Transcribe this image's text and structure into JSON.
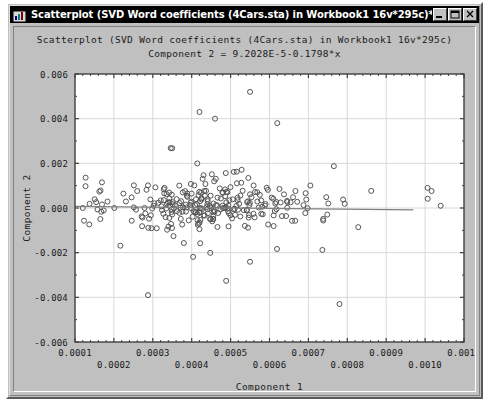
{
  "window": {
    "title": "Scatterplot (SVD Word coefficients (4Cars.sta) in Workbook1 16v*295c)*",
    "icon": "statistica-graph-icon",
    "controls": {
      "minimize": "Minimize",
      "maximize": "Maximize",
      "close": "Close"
    }
  },
  "chart_data": {
    "type": "scatter",
    "title": "Scatterplot (SVD Word coefficients (4Cars.sta) in Workbook1 16v*295c)",
    "subtitle": "Component 2 = 9.2028E-5-0.1798*x",
    "xlabel": "Component 1",
    "ylabel": "Component 2",
    "xlim": [
      0.0001,
      0.0011
    ],
    "ylim": [
      -0.006,
      0.006
    ],
    "xticks": [
      0.0001,
      0.0002,
      0.0003,
      0.0004,
      0.0005,
      0.0006,
      0.0007,
      0.0008,
      0.0009,
      0.001,
      0.0011
    ],
    "xtick_labels": [
      "0.0001",
      "0.0002",
      "0.0003",
      "0.0004",
      "0.0005",
      "0.0006",
      "0.0007",
      "0.0008",
      "0.0009",
      "0.0010",
      "0.0011"
    ],
    "xtick_stagger": true,
    "yticks": [
      0.006,
      0.004,
      0.002,
      0.0,
      -0.002,
      -0.004,
      -0.006
    ],
    "ytick_labels": [
      "0.006",
      "0.004",
      "0.002",
      "0.000",
      "-0.002",
      "-0.004",
      "-0.006"
    ],
    "grid": true,
    "minor_ticks_per_interval": 5,
    "marker": {
      "shape": "open-circle",
      "size": 5,
      "color": "#555555",
      "fill": "none"
    },
    "fit_line": {
      "label": "Component 2 = 9.2028E-5-0.1798*x",
      "intercept": 9.2028e-05,
      "slope": -0.1798,
      "color": "#808080",
      "x_start": 0.0001,
      "x_end": 0.00097
    },
    "n_points": 295,
    "point_generation": {
      "seed": 20250214,
      "x_mode": 0.00045,
      "x_spread": 0.00017,
      "x_min": 0.000115,
      "x_max": 0.00105,
      "y_center": 0.0001,
      "y_spread": 0.00105,
      "y_min": -0.0044,
      "y_max": 0.0053
    },
    "notable_points": [
      {
        "x": 0.00055,
        "y": 0.0052
      },
      {
        "x": 0.00078,
        "y": -0.0043
      },
      {
        "x": 0.00042,
        "y": 0.0043
      },
      {
        "x": 0.00046,
        "y": 0.004
      },
      {
        "x": 0.00062,
        "y": 0.0038
      },
      {
        "x": 0.00104,
        "y": 0.0001
      },
      {
        "x": 0.00012,
        "y": 0.0
      }
    ],
    "colors": {
      "plot_background": "#ffffff",
      "panel_background": "#c0c0c0",
      "grid": "#d8d8d8",
      "frame": "#404040",
      "text": "#1a1a1a"
    }
  }
}
